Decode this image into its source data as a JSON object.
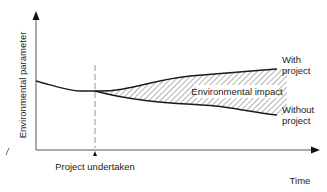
{
  "diagram": {
    "y_axis_label": "Environmental parameter",
    "x_axis_label": "Time",
    "event_label": "Project undertaken",
    "region_label": "Environmental impact",
    "upper_curve_label_line1": "With",
    "upper_curve_label_line2": "project",
    "lower_curve_label_line1": "Without",
    "lower_curve_label_line2": "project",
    "colors": {
      "line": "#1a1a1a",
      "dashed": "#888888",
      "hatch": "#555555",
      "text": "#222222"
    }
  }
}
